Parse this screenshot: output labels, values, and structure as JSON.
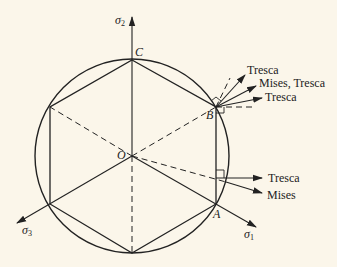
{
  "diagram": {
    "title": "",
    "colors": {
      "background": "#fbf6ea",
      "ink": "#222222"
    },
    "axes": [
      {
        "id": "sigma2",
        "symbol": "σ",
        "subscript": "2"
      },
      {
        "id": "sigma1",
        "symbol": "σ",
        "subscript": "1"
      },
      {
        "id": "sigma3",
        "symbol": "σ",
        "subscript": "3"
      }
    ],
    "points": {
      "origin": "O",
      "A": "A",
      "B": "B",
      "C": "C"
    },
    "flow_directions": {
      "B_upper": "Tresca",
      "B_middle": "Mises, Tresca",
      "B_lower": "Tresca",
      "side_tresca": "Tresca",
      "side_mises": "Mises"
    },
    "shapes": {
      "circle": "Mises yield circle",
      "hexagon": "Tresca yield hexagon"
    }
  }
}
